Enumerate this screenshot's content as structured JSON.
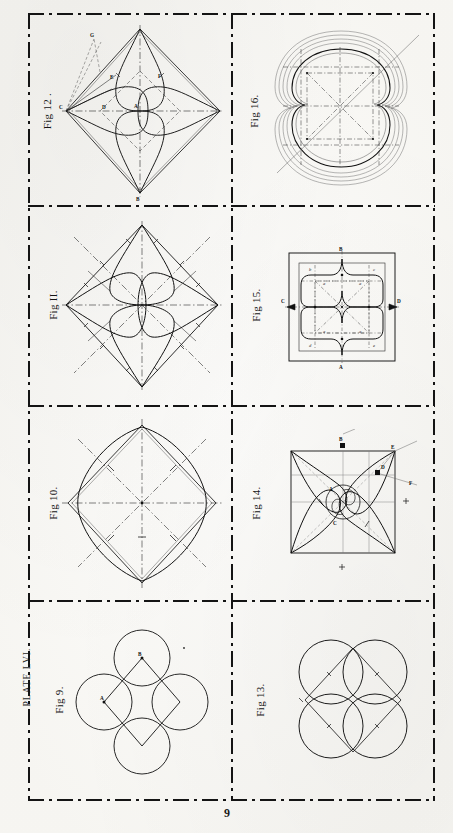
{
  "plate": {
    "label": "Plate LVI.",
    "page_number": "9"
  },
  "figures": [
    {
      "id": "fig9",
      "caption": "Fig 9.",
      "description": "Square with four semicircles / circles on its sides forming a quatrefoil",
      "labels": [
        "A",
        "B"
      ],
      "cell": {
        "col": 0,
        "row": 3
      }
    },
    {
      "id": "fig10",
      "caption": "Fig 10.",
      "description": "Square set on point with inscribed four-arc quatrefoil and dash-dot diagonals",
      "labels": [],
      "cell": {
        "col": 0,
        "row": 2
      }
    },
    {
      "id": "fig11",
      "caption": "Fig II.",
      "description": "Square on point with four pointed petals and dash-dot axes",
      "labels": [],
      "cell": {
        "col": 0,
        "row": 1
      }
    },
    {
      "id": "fig12",
      "caption": "Fig 12 .",
      "description": "Square on point with four ogee petals, inner diamond and construction rays",
      "labels": [
        "G",
        "E",
        "F",
        "C",
        "D",
        "A",
        "B"
      ],
      "cell": {
        "col": 0,
        "row": 0
      }
    },
    {
      "id": "fig13",
      "caption": "Fig 13.",
      "description": "Four overlapping circles on the corners of a square forming a four-leaf rosette",
      "labels": [],
      "cell": {
        "col": 1,
        "row": 3
      }
    },
    {
      "id": "fig14",
      "caption": "Fig 14.",
      "description": "Square with four swirling pointed leaves rotating about the centre, with construction lines",
      "labels": [
        "B",
        "E",
        "D",
        "F",
        "A",
        "C"
      ],
      "cell": {
        "col": 1,
        "row": 2
      }
    },
    {
      "id": "fig15",
      "caption": "Fig 15.",
      "description": "Square panel with inner fretted quatrefoil outline and dash-dot construction grid",
      "labels": [
        "A",
        "B",
        "C",
        "D",
        "a",
        "a",
        "a",
        "a",
        "b",
        "c",
        "d",
        "e"
      ],
      "cell": {
        "col": 1,
        "row": 1
      }
    },
    {
      "id": "fig16",
      "caption": "Fig 16.",
      "description": "Quatrefoil rosette with multiple concentric moulding outlines and dash-dot diagonals",
      "labels": [],
      "cell": {
        "col": 1,
        "row": 0
      }
    }
  ],
  "colors": {
    "ink": "#141414",
    "faint_ink": "#6d6d6d",
    "paper": "#fcfbf7"
  }
}
